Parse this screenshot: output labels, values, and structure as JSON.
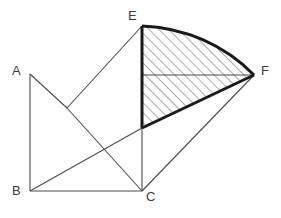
{
  "figure": {
    "type": "geometry-diagram",
    "width": 281,
    "height": 218,
    "background_color": "#ffffff",
    "line_color": "#4a4a4a",
    "bold_line_color": "#1a1a1a",
    "hatch_color": "#555555",
    "label_color": "#3b3b3b"
  },
  "labels": {
    "a": "A",
    "b": "B",
    "c": "C",
    "e": "E",
    "f": "F"
  },
  "points": {
    "A": {
      "x": 30,
      "y": 74
    },
    "B": {
      "x": 30,
      "y": 191
    },
    "C": {
      "x": 142,
      "y": 191
    },
    "E": {
      "x": 142,
      "y": 26
    },
    "F": {
      "x": 254,
      "y": 75
    },
    "V": {
      "x": 67,
      "y": 108
    },
    "D": {
      "x": 142,
      "y": 128
    },
    "M": {
      "x": 142,
      "y": 75
    }
  },
  "segments": [
    {
      "name": "segment-A-B",
      "from": "A",
      "to": "B",
      "weight": "thin"
    },
    {
      "name": "segment-B-C",
      "from": "B",
      "to": "C",
      "weight": "thin"
    },
    {
      "name": "segment-A-V",
      "from": "A",
      "to": "V",
      "weight": "thin"
    },
    {
      "name": "segment-V-E",
      "from": "V",
      "to": "E",
      "weight": "thin"
    },
    {
      "name": "segment-V-C",
      "from": "V",
      "to": "C",
      "weight": "thin"
    },
    {
      "name": "segment-B-D",
      "from": "B",
      "to": "D",
      "weight": "thin"
    },
    {
      "name": "segment-D-C",
      "from": "D",
      "to": "C",
      "weight": "thin"
    },
    {
      "name": "segment-C-F",
      "from": "C",
      "to": "F",
      "weight": "thin"
    },
    {
      "name": "segment-M-F",
      "from": "M",
      "to": "F",
      "weight": "thin"
    },
    {
      "name": "segment-E-D",
      "from": "E",
      "to": "D",
      "weight": "bold"
    },
    {
      "name": "segment-D-F",
      "from": "D",
      "to": "F",
      "weight": "bold"
    }
  ],
  "arc": {
    "name": "arc-E-F",
    "from": "E",
    "to": "F",
    "center": "C",
    "radius": 165,
    "weight": "bold"
  },
  "shaded_region": {
    "name": "hatched-sector-EDF",
    "hatch_angle_degrees": 45,
    "hatch_spacing": 7,
    "boundary": [
      "E",
      "arc-E-F",
      "F",
      "D",
      "E"
    ]
  }
}
